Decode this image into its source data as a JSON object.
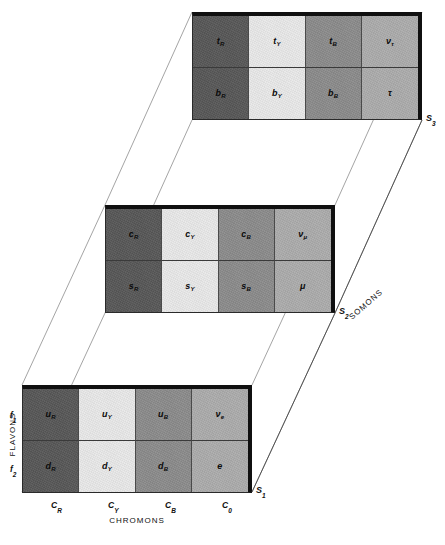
{
  "figure": {
    "axes": {
      "rows_axis_title": "FLAVONS",
      "cols_axis_title": "CHROMONS",
      "depth_axis_title": "SOMONS",
      "row_tick_1": "f",
      "row_tick_1_sub": "1",
      "row_tick_2": "f",
      "row_tick_2_sub": "2",
      "col_ticks": [
        {
          "base": "C",
          "sub": "R"
        },
        {
          "base": "C",
          "sub": "Y"
        },
        {
          "base": "C",
          "sub": "B"
        },
        {
          "base": "C",
          "sub": "0"
        }
      ]
    },
    "colors": {
      "red_chromon": "#575757",
      "yellow_chromon": "#e9e9e9",
      "blue_chromon": "#8b8b8b",
      "neutral_chromon": "#acacac",
      "border": "#101010",
      "grid_line": "#4a4a4a",
      "connector_line": "#9a9a9a",
      "background": "#ffffff",
      "text": "#111111"
    },
    "layers": [
      {
        "name": "somon-1",
        "marker": "S",
        "marker_sub": "1",
        "cells": [
          {
            "base": "u",
            "sub": "R",
            "tone": "c-dark",
            "greek": false
          },
          {
            "base": "u",
            "sub": "Y",
            "tone": "c-light",
            "greek": false
          },
          {
            "base": "u",
            "sub": "B",
            "tone": "c-mid",
            "greek": false
          },
          {
            "base": "ν",
            "sub": "e",
            "tone": "c-pale",
            "greek": true
          },
          {
            "base": "d",
            "sub": "R",
            "tone": "c-dark",
            "greek": false
          },
          {
            "base": "d",
            "sub": "Y",
            "tone": "c-light",
            "greek": false
          },
          {
            "base": "d",
            "sub": "B",
            "tone": "c-mid",
            "greek": false
          },
          {
            "base": "e",
            "sub": "",
            "tone": "c-pale",
            "greek": false
          }
        ]
      },
      {
        "name": "somon-2",
        "marker": "S",
        "marker_sub": "2",
        "cells": [
          {
            "base": "c",
            "sub": "R",
            "tone": "c-dark",
            "greek": false
          },
          {
            "base": "c",
            "sub": "Y",
            "tone": "c-light",
            "greek": false
          },
          {
            "base": "c",
            "sub": "B",
            "tone": "c-mid",
            "greek": false
          },
          {
            "base": "ν",
            "sub": "μ",
            "tone": "c-pale",
            "greek": true
          },
          {
            "base": "s",
            "sub": "R",
            "tone": "c-dark",
            "greek": false
          },
          {
            "base": "s",
            "sub": "Y",
            "tone": "c-light",
            "greek": false
          },
          {
            "base": "s",
            "sub": "B",
            "tone": "c-mid",
            "greek": false
          },
          {
            "base": "μ",
            "sub": "",
            "tone": "c-pale",
            "greek": true
          }
        ]
      },
      {
        "name": "somon-3",
        "marker": "S",
        "marker_sub": "3",
        "cells": [
          {
            "base": "t",
            "sub": "R",
            "tone": "c-dark",
            "greek": false
          },
          {
            "base": "t",
            "sub": "Y",
            "tone": "c-light",
            "greek": false
          },
          {
            "base": "t",
            "sub": "B",
            "tone": "c-mid",
            "greek": false
          },
          {
            "base": "ν",
            "sub": "τ",
            "tone": "c-pale",
            "greek": true
          },
          {
            "base": "b",
            "sub": "R",
            "tone": "c-dark",
            "greek": false
          },
          {
            "base": "b",
            "sub": "Y",
            "tone": "c-light",
            "greek": false
          },
          {
            "base": "b",
            "sub": "B",
            "tone": "c-mid",
            "greek": false
          },
          {
            "base": "τ",
            "sub": "",
            "tone": "c-pale",
            "greek": true
          }
        ]
      }
    ]
  }
}
